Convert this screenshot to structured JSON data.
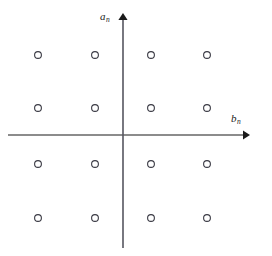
{
  "figure": {
    "name": "constellation-lattice-diagram",
    "background_color": "#ffffff",
    "width": 272,
    "height": 256
  },
  "axes": {
    "vertical": {
      "label_symbol": "a",
      "label_subscript": "n",
      "name": "a_n",
      "color": "#4a4a4a",
      "origin_x": 123,
      "top_y": 14,
      "bottom_y": 248,
      "arrow": "up"
    },
    "horizontal": {
      "label_symbol": "b",
      "label_subscript": "n",
      "name": "b_n",
      "color": "#1a1a1a",
      "origin_y": 135,
      "left_x": 8,
      "right_x": 248,
      "arrow": "right"
    }
  },
  "chart_data": {
    "type": "scatter",
    "title": "",
    "xlabel": "b_n",
    "ylabel": "a_n",
    "grid": false,
    "legend": null,
    "marker": {
      "shape": "circle",
      "filled": false,
      "radius_px": 3.4,
      "stroke_color": "#3a3a44",
      "stroke_width_px": 1.1,
      "fill_color": "#ffffff"
    },
    "xlim": [
      -3,
      3
    ],
    "ylim": [
      -3,
      3
    ],
    "x_columns_px": [
      38,
      95,
      151,
      207
    ],
    "y_rows_px": [
      55,
      108,
      164,
      218
    ],
    "x": [
      -3,
      -1,
      1,
      3,
      -3,
      -1,
      1,
      3,
      -3,
      -1,
      1,
      3,
      -3,
      -1,
      1,
      3
    ],
    "y": [
      3,
      3,
      3,
      3,
      1,
      1,
      1,
      1,
      -1,
      -1,
      -1,
      -1,
      -3,
      -3,
      -3,
      -3
    ],
    "points": [
      {
        "x": -3,
        "y": 3,
        "px": 38,
        "py": 55
      },
      {
        "x": -1,
        "y": 3,
        "px": 95,
        "py": 55
      },
      {
        "x": 1,
        "y": 3,
        "px": 151,
        "py": 55
      },
      {
        "x": 3,
        "y": 3,
        "px": 207,
        "py": 55
      },
      {
        "x": -3,
        "y": 1,
        "px": 38,
        "py": 108
      },
      {
        "x": -1,
        "y": 1,
        "px": 95,
        "py": 108
      },
      {
        "x": 1,
        "y": 1,
        "px": 151,
        "py": 108
      },
      {
        "x": 3,
        "y": 1,
        "px": 207,
        "py": 108
      },
      {
        "x": -3,
        "y": -1,
        "px": 38,
        "py": 164
      },
      {
        "x": -1,
        "y": -1,
        "px": 95,
        "py": 164
      },
      {
        "x": 1,
        "y": -1,
        "px": 151,
        "py": 164
      },
      {
        "x": 3,
        "y": -1,
        "px": 207,
        "py": 164
      },
      {
        "x": -3,
        "y": -3,
        "px": 38,
        "py": 218
      },
      {
        "x": -1,
        "y": -3,
        "px": 95,
        "py": 218
      },
      {
        "x": 1,
        "y": -3,
        "px": 151,
        "py": 218
      },
      {
        "x": 3,
        "y": -3,
        "px": 207,
        "py": 218
      }
    ],
    "point_count": 16
  }
}
